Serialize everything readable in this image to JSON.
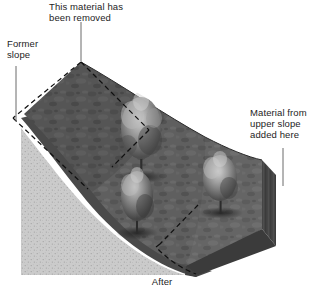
{
  "figure": {
    "caption": "After",
    "background_color": "#ffffff",
    "text_color": "#1d1d1d"
  },
  "annotations": {
    "removed": {
      "text": "This material has\nbeen removed",
      "leader": "vertical-leader-line"
    },
    "former_slope": {
      "text": "Former\nslope",
      "leader": "vertical-leader-line"
    },
    "added_material": {
      "text": "Material from\nupper slope\nadded here",
      "leader": "vertical-leader-line"
    }
  },
  "diagram": {
    "type": "block-diagram-cross-section",
    "elements": {
      "slope_surface": {
        "name": "regraded-slope-surface",
        "fill": "#5e5e5e",
        "texture": "mottled-vegetated-ground"
      },
      "cut_bank_edge": {
        "name": "soil-edge-band",
        "fill": "#4a4a4a"
      },
      "cross_section_face": {
        "name": "stippled-substrate-face",
        "fill": "#c9c9c9",
        "texture": "stipple-dots"
      },
      "former_slope_outline": {
        "name": "former-slope-dashed-outline",
        "stroke": "#141414",
        "style": "dashed"
      },
      "fill_outline": {
        "name": "added-fill-dashed-outline",
        "stroke": "#141414",
        "style": "dashed"
      },
      "right_face": {
        "name": "right-end-face",
        "fill": "#4f4f4f"
      },
      "front_face": {
        "name": "front-end-face",
        "fill": "#3f3f3f"
      }
    },
    "trees": [
      {
        "name": "tree-upper",
        "x": 141,
        "y": 140,
        "height": 78
      },
      {
        "name": "tree-middle",
        "x": 137,
        "y": 207,
        "height": 58
      },
      {
        "name": "tree-lower-right",
        "x": 220,
        "y": 189,
        "height": 52
      }
    ]
  }
}
